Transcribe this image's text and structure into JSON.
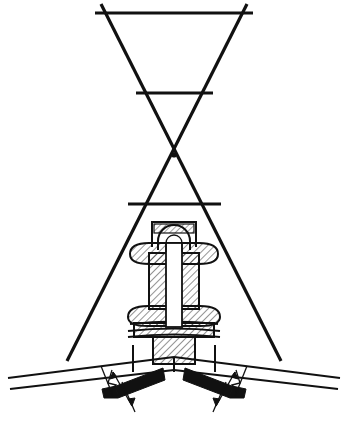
{
  "drawing": {
    "title": "Sectioned insulator mounting at roof ridge with guy-wire triangle",
    "domain_kind": "engineering-line-drawing",
    "canvas": {
      "width": 348,
      "height": 421,
      "background": "#ffffff"
    },
    "ink_color": "#111111",
    "fill_color": "#111111",
    "paper_color": "#ffffff",
    "labels": [],
    "callout_text": "",
    "annotations": {
      "break_symbol_left": "",
      "break_symbol_right": "",
      "dimension_left": "",
      "dimension_right": ""
    },
    "parts": {
      "guy_triangle": "inverted triangle of crossed guy wires",
      "crossbar_top": "upper horizontal spreader bar",
      "crossbar_middle": "middle horizontal spreader bar",
      "crossbar_lower": "lower horizontal spreader bar",
      "crossing_point": "X intersection of the two guy wires",
      "insulator_body": "hatched sectioned insulator column",
      "shackle": "arched U shackle at top of insulator",
      "upper_collar": "upper bulged collar of insulator",
      "lower_collar": "lower bulged collar of insulator",
      "washer_stack": "stacked washers / flange plate",
      "base_block": "hatched base mounting block",
      "roof_arm_left": "left sloping roof rafter arm",
      "roof_arm_right": "right sloping roof rafter arm",
      "ridge_apex": "ridge apex where the two roof arms meet",
      "batten_left": "solid black batten bar on left roof arm",
      "batten_right": "solid black batten bar on right roof arm"
    },
    "geometry": {
      "crossbar_top_y": 13,
      "crossbar_middle_y": 93,
      "crossbar_lower_y": 204,
      "x_crossing": {
        "x": 174,
        "y": 155
      },
      "ridge_apex": {
        "x": 174,
        "y": 360
      },
      "insulator_axis_x": 174,
      "insulator_top_y": 222,
      "insulator_base_y": 363
    },
    "hatch": {
      "angle_deg": 45,
      "spacing_px": 5,
      "stroke_width": 0.9
    }
  }
}
